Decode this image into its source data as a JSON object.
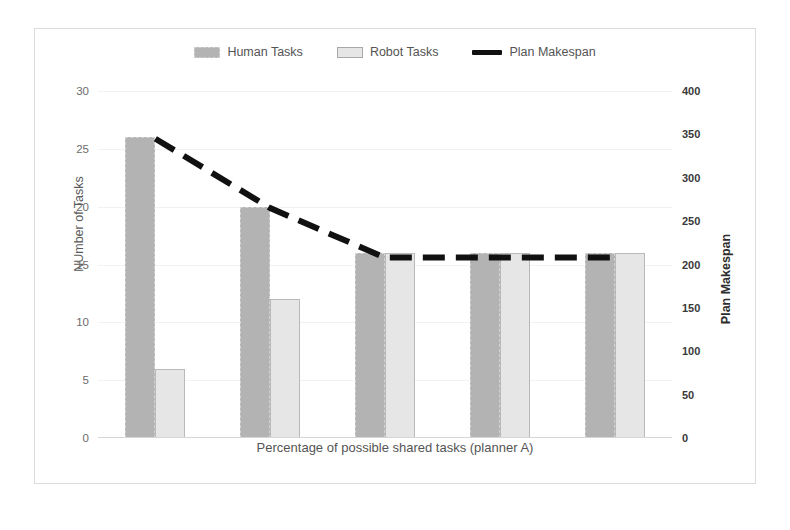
{
  "chart_data": {
    "type": "bar",
    "title": "",
    "xlabel": "Percentage of possible shared tasks (planner A)",
    "ylabel": "NUmber of Tasks",
    "y2label": "Plan Makespan",
    "categories": [
      "20%",
      "40%",
      "60%",
      "80%",
      "100%"
    ],
    "ylim": [
      0,
      30
    ],
    "yticks": [
      0,
      5,
      10,
      15,
      20,
      25,
      30
    ],
    "y2lim": [
      0,
      400
    ],
    "y2ticks": [
      0,
      50,
      100,
      150,
      200,
      250,
      300,
      350,
      400
    ],
    "grid": true,
    "legend_position": "top-center",
    "series": [
      {
        "name": "Human Tasks",
        "type": "bar",
        "axis": "left",
        "color": "#b3b3b3",
        "values": [
          26,
          20,
          16,
          16,
          16
        ]
      },
      {
        "name": "Robot Tasks",
        "type": "bar",
        "axis": "left",
        "color": "#e6e6e6",
        "values": [
          6,
          12,
          16,
          16,
          16
        ]
      },
      {
        "name": "Plan Makespan",
        "type": "line",
        "axis": "right",
        "color": "#111111",
        "style": "dashed",
        "values": [
          345,
          265,
          208,
          208,
          208
        ]
      }
    ]
  },
  "legend": {
    "items": [
      {
        "label": "Human Tasks",
        "marker": "bar-swatch-human"
      },
      {
        "label": "Robot Tasks",
        "marker": "bar-swatch-robot"
      },
      {
        "label": "Plan Makespan",
        "marker": "line-swatch-black"
      }
    ]
  },
  "axes": {
    "left": {
      "title": "NUmber of Tasks",
      "ticks": [
        "30",
        "25",
        "20",
        "15",
        "10",
        "5",
        "0"
      ]
    },
    "right": {
      "title": "Plan Makespan",
      "ticks": [
        "400",
        "350",
        "300",
        "250",
        "200",
        "150",
        "100",
        "50",
        "0"
      ]
    },
    "bottom": {
      "title": "Percentage of possible shared tasks (planner A)",
      "ticks": [
        "20%",
        "40%",
        "60%",
        "80%",
        "100%"
      ]
    }
  },
  "colors": {
    "human_bar": "#b3b3b3",
    "robot_bar": "#e6e6e6",
    "makespan_line": "#111111",
    "frame_border": "#dcdcdc",
    "gridline": "#f2f2f2"
  }
}
